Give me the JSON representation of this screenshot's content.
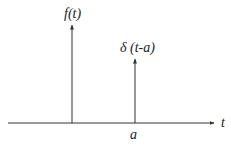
{
  "diagram": {
    "labels": {
      "f_label": "f(t)",
      "delta_label": "δ (t-a)",
      "axis_label": "t",
      "shift_label": "a"
    },
    "elements": [
      {
        "type": "arrow",
        "name": "f(t) impulse",
        "x": 72,
        "y_from": 123,
        "y_to": 24
      },
      {
        "type": "arrow",
        "name": "δ(t-a) impulse",
        "x": 135,
        "y_from": 123,
        "y_to": 58
      },
      {
        "type": "arrow",
        "name": "t-axis",
        "x_from": 8,
        "x_to": 215,
        "y": 123
      }
    ],
    "colors": {
      "line": "#333333",
      "background": "#ffffff"
    }
  }
}
